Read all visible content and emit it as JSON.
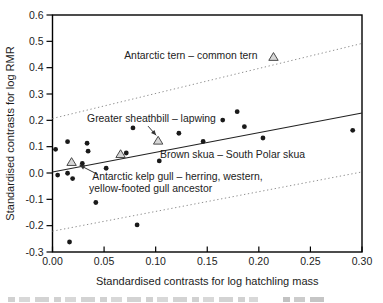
{
  "figure": {
    "name": "scatter-plot-rmr-vs-hatchling-mass"
  },
  "chart_data": {
    "type": "scatter",
    "title": "",
    "xlabel": "Standardised contrasts for log hatchling mass",
    "ylabel": "Standardised contrasts for log RMR",
    "xlim": [
      0,
      0.3
    ],
    "ylim": [
      -0.3,
      0.6
    ],
    "grid": false,
    "xticks": {
      "values": [
        0,
        0.05,
        0.1,
        0.15,
        0.2,
        0.25,
        0.3
      ],
      "labels": [
        "0.00",
        "0.05",
        "0.10",
        "0.15",
        "0.20",
        "0.25",
        "0.30"
      ]
    },
    "yticks": {
      "values": [
        0.6,
        0.5,
        0.4,
        0.3,
        0.2,
        0.1,
        0.0,
        -0.1,
        -0.2,
        -0.3
      ],
      "labels": [
        "0.6",
        "0.5",
        "0.4",
        "0.3",
        "0.2",
        "0.1",
        "0.0",
        "-0.1",
        "-0.2",
        "-0.3"
      ]
    },
    "series": [
      {
        "name": "species-pair-contrasts",
        "marker": "circle",
        "color": "#1a1a1a",
        "points": [
          [
            0.003,
            0.09
          ],
          [
            0.005,
            -0.008
          ],
          [
            0.0146,
            0.119
          ],
          [
            0.0146,
            -0.001
          ],
          [
            0.0165,
            -0.262
          ],
          [
            0.0195,
            -0.021
          ],
          [
            0.0289,
            0.036
          ],
          [
            0.0335,
            0.113
          ],
          [
            0.0345,
            0.083
          ],
          [
            0.042,
            -0.112
          ],
          [
            0.052,
            0.018
          ],
          [
            0.0715,
            0.076
          ],
          [
            0.078,
            0.171
          ],
          [
            0.082,
            -0.197
          ],
          [
            0.1035,
            0.046
          ],
          [
            0.1225,
            0.151
          ],
          [
            0.146,
            0.12
          ],
          [
            0.165,
            0.201
          ],
          [
            0.179,
            0.233
          ],
          [
            0.186,
            0.176
          ],
          [
            0.204,
            0.133
          ],
          [
            0.291,
            0.162
          ]
        ]
      },
      {
        "name": "highlighted-antarctic-contrasts",
        "marker": "triangle",
        "fill": "#d6d6d6",
        "stroke": "#4a4a4a",
        "points": [
          [
            0.0185,
            0.042
          ],
          [
            0.066,
            0.072
          ],
          [
            0.1024,
            0.123
          ],
          [
            0.2142,
            0.441
          ]
        ]
      }
    ],
    "lines": [
      {
        "name": "regression-line",
        "style": "solid",
        "color": "#222222",
        "x1": 0,
        "y1": 0.004,
        "x2": 0.3,
        "y2": 0.228
      },
      {
        "name": "confidence-band-upper",
        "style": "dotted",
        "color": "#8f8f8f",
        "x1": 0,
        "y1": 0.207,
        "x2": 0.3,
        "y2": 0.492
      },
      {
        "name": "confidence-band-lower",
        "style": "dotted",
        "color": "#8f8f8f",
        "x1": 0,
        "y1": -0.221,
        "x2": 0.3,
        "y2": 0.004
      }
    ],
    "annotations": [
      {
        "id": "tern",
        "text": "Antarctic tern – common tern",
        "x": 0.0695,
        "y": 0.448
      },
      {
        "id": "sheathbill",
        "text": "Greater sheathbill – lapwing",
        "x": 0.0335,
        "y": 0.209,
        "arrow": {
          "x1": 0.0926,
          "y1": 0.178,
          "x2": 0.1005,
          "y2": 0.143
        }
      },
      {
        "id": "brown-skua",
        "text": "Brown skua – South Polar skua",
        "x": 0.1042,
        "y": 0.072
      },
      {
        "id": "kelp-gull-line1",
        "text": "Antarctic kelp gull – herring, western,",
        "x": 0.0385,
        "y": -0.014,
        "arrow": {
          "x1": 0.0441,
          "y1": -0.006,
          "x2": 0.0262,
          "y2": 0.03
        }
      },
      {
        "id": "kelp-gull-line2",
        "text": "yellow-footed gull ancestor",
        "x": 0.0355,
        "y": -0.06
      }
    ],
    "colors": {
      "frame": "#000000",
      "text": "#1c1c1c",
      "annotation_text": "#222222",
      "arrow": "#333333",
      "background": "#ffffff"
    }
  }
}
